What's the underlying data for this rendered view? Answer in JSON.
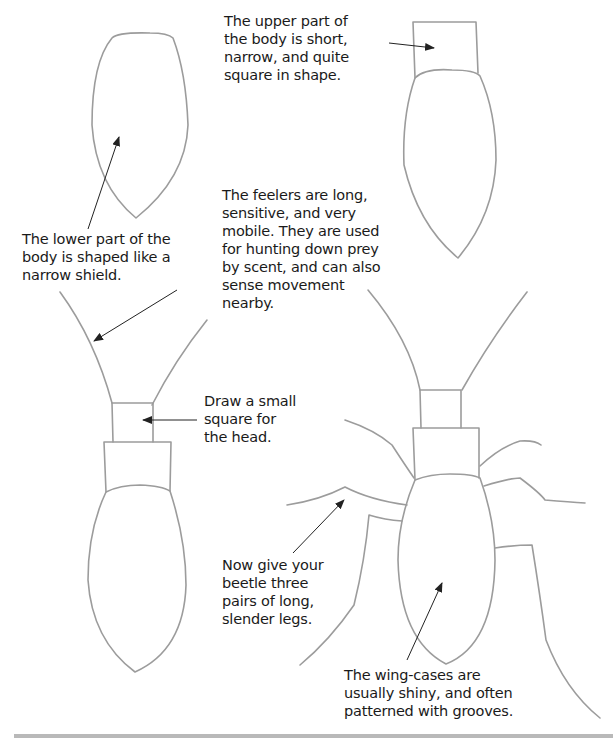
{
  "captions": {
    "upper_body": {
      "lines": [
        "The upper part of",
        "the body is short,",
        "narrow, and quite",
        "square in shape."
      ]
    },
    "lower_body": {
      "lines": [
        "The lower part of the",
        "body is shaped like a",
        "narrow shield."
      ]
    },
    "feelers": {
      "lines": [
        "The feelers are long,",
        "sensitive, and very",
        "mobile. They are used",
        "for hunting down prey",
        "by scent, and can also",
        "sense movement",
        "nearby."
      ]
    },
    "head": {
      "lines": [
        "Draw a small",
        "square for",
        "the head."
      ]
    },
    "legs": {
      "lines": [
        "Now give your",
        "beetle three",
        "pairs of long,",
        "slender legs."
      ]
    },
    "wing_cases": {
      "lines": [
        "The wing-cases are",
        "usually shiny, and often",
        "patterned with grooves."
      ]
    }
  },
  "colors": {
    "pencil": "#9a9a9a",
    "arrow": "#222222",
    "text": "#1a1a1a",
    "footer": "#b9b9b9"
  },
  "steps": [
    {
      "step": 1,
      "name": "lower-body-shield"
    },
    {
      "step": 2,
      "name": "upper-body-square"
    },
    {
      "step": 3,
      "name": "head-and-feelers"
    },
    {
      "step": 4,
      "name": "legs-and-wing-cases"
    }
  ]
}
